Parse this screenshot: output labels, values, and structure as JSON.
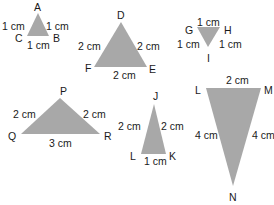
{
  "colors": {
    "fill": "#a8a8a8",
    "text": "#1a1a1a",
    "background": "#ffffff"
  },
  "triangles": [
    {
      "name": "ABC",
      "points": [
        [
          38,
          13
        ],
        [
          27,
          36
        ],
        [
          49,
          36
        ]
      ],
      "labels": [
        {
          "text": "A",
          "x": 34,
          "y": 11
        },
        {
          "text": "C",
          "x": 15,
          "y": 42
        },
        {
          "text": "B",
          "x": 53,
          "y": 42
        },
        {
          "text": "1 cm",
          "x": 2,
          "y": 30
        },
        {
          "text": "1 cm",
          "x": 46,
          "y": 30
        },
        {
          "text": "1 cm",
          "x": 27,
          "y": 49
        }
      ]
    },
    {
      "name": "DEF",
      "points": [
        [
          121,
          22
        ],
        [
          94,
          67
        ],
        [
          147,
          67
        ]
      ],
      "labels": [
        {
          "text": "D",
          "x": 117,
          "y": 19
        },
        {
          "text": "F",
          "x": 85,
          "y": 72
        },
        {
          "text": "E",
          "x": 149,
          "y": 73
        },
        {
          "text": "2 cm",
          "x": 78,
          "y": 50
        },
        {
          "text": "2 cm",
          "x": 137,
          "y": 50
        },
        {
          "text": "2 cm",
          "x": 113,
          "y": 79
        }
      ]
    },
    {
      "name": "GHI",
      "points": [
        [
          197,
          27
        ],
        [
          220,
          27
        ],
        [
          208,
          47
        ]
      ],
      "labels": [
        {
          "text": "G",
          "x": 185,
          "y": 34
        },
        {
          "text": "H",
          "x": 224,
          "y": 34
        },
        {
          "text": "I",
          "x": 207,
          "y": 62
        },
        {
          "text": "1 cm",
          "x": 197,
          "y": 26
        },
        {
          "text": "1 cm",
          "x": 177,
          "y": 48
        },
        {
          "text": "1 cm",
          "x": 219,
          "y": 48
        }
      ]
    },
    {
      "name": "PQR",
      "points": [
        [
          60,
          98
        ],
        [
          21,
          134
        ],
        [
          100,
          134
        ]
      ],
      "labels": [
        {
          "text": "P",
          "x": 60,
          "y": 95
        },
        {
          "text": "Q",
          "x": 8,
          "y": 140
        },
        {
          "text": "R",
          "x": 104,
          "y": 140
        },
        {
          "text": "2 cm",
          "x": 13,
          "y": 118
        },
        {
          "text": "2 cm",
          "x": 83,
          "y": 118
        },
        {
          "text": "3 cm",
          "x": 49,
          "y": 147
        }
      ]
    },
    {
      "name": "JKL",
      "points": [
        [
          154,
          104
        ],
        [
          141,
          154
        ],
        [
          166,
          154
        ]
      ],
      "labels": [
        {
          "text": "J",
          "x": 153,
          "y": 100
        },
        {
          "text": "L",
          "x": 130,
          "y": 160
        },
        {
          "text": "K",
          "x": 169,
          "y": 160
        },
        {
          "text": "2 cm",
          "x": 118,
          "y": 130
        },
        {
          "text": "2 cm",
          "x": 161,
          "y": 130
        },
        {
          "text": "1 cm",
          "x": 144,
          "y": 165
        }
      ]
    },
    {
      "name": "LMN",
      "points": [
        [
          206,
          88
        ],
        [
          261,
          88
        ],
        [
          233,
          186
        ]
      ],
      "labels": [
        {
          "text": "L",
          "x": 195,
          "y": 94
        },
        {
          "text": "M",
          "x": 264,
          "y": 94
        },
        {
          "text": "N",
          "x": 229,
          "y": 201
        },
        {
          "text": "2 cm",
          "x": 226,
          "y": 84
        },
        {
          "text": "4 cm",
          "x": 195,
          "y": 139
        },
        {
          "text": "4 cm",
          "x": 252,
          "y": 139
        }
      ]
    }
  ]
}
